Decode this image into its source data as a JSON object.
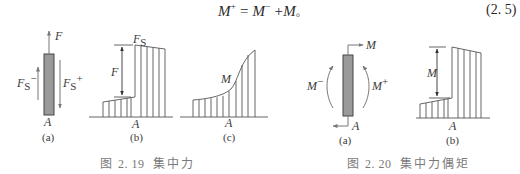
{
  "equation": {
    "lhs": "M",
    "lhs_sup": "+",
    "equals": " = ",
    "rhs1": "M",
    "rhs1_sup": "−",
    "plus": " +",
    "rhs2": "M",
    "end": "。",
    "number": "(2. 5)"
  },
  "figure_2_19": {
    "caption_prefix": "图",
    "caption_number": "2. 19",
    "caption_title": "集中力",
    "panel_a": {
      "label": "(a)",
      "force_label": "F",
      "shear_left_label": "F",
      "shear_left_sub": "S",
      "shear_left_sup": "−",
      "shear_right_label": "F",
      "shear_right_sub": "S",
      "shear_right_sup": "+",
      "point_label": "A"
    },
    "panel_b": {
      "label": "(b)",
      "axis_label": "F",
      "axis_sub": "S",
      "jump_label": "F",
      "point_label": "A"
    },
    "panel_c": {
      "label": "(c)",
      "curve_label": "M",
      "point_label": "A"
    }
  },
  "figure_2_20": {
    "caption_prefix": "图",
    "caption_number": "2. 20",
    "caption_title": "集中力偶矩",
    "panel_a": {
      "label": "(a)",
      "moment_label": "M",
      "moment_left_label": "M",
      "moment_left_sup": "−",
      "moment_right_label": "M",
      "moment_right_sup": "+",
      "point_label": "A"
    },
    "panel_b": {
      "label": "(b)",
      "jump_label": "M",
      "point_label": "A"
    }
  },
  "colors": {
    "line": "#555555",
    "arrow": "#777777",
    "bar_fill": "#9a9a9a",
    "caption": "#7a7a7a"
  }
}
